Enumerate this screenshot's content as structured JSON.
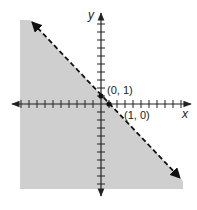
{
  "chart_data": {
    "type": "inequality-graph",
    "title": "",
    "xlabel": "x",
    "ylabel": "y",
    "xlim": [
      -10,
      10
    ],
    "ylim": [
      -11,
      11
    ],
    "grid": false,
    "tick_step": 1,
    "boundary_line": {
      "equation": "y = -x + 1",
      "slope": -1,
      "intercept": 1,
      "style": "dashed",
      "arrows": "both"
    },
    "shaded_region": "below-left of line (x + y < 1)",
    "points": [
      {
        "x": 0,
        "y": 1,
        "label": "(0, 1)"
      },
      {
        "x": 1,
        "y": 0,
        "label": "(1, 0)"
      }
    ]
  },
  "labels": {
    "x_axis": "x",
    "y_axis": "y",
    "point_a": "(0, 1)",
    "point_b": "(1, 0)"
  },
  "colors": {
    "shade": "#cfcfcf",
    "axis": "#222222",
    "line": "#111111"
  }
}
